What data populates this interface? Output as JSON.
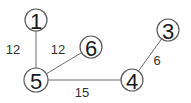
{
  "graph": {
    "nodes": [
      {
        "id": "1",
        "label": "1",
        "x": 36,
        "y": 20,
        "r": 11
      },
      {
        "id": "5",
        "label": "5",
        "x": 36,
        "y": 80,
        "r": 12
      },
      {
        "id": "6",
        "label": "6",
        "x": 91,
        "y": 47,
        "r": 11
      },
      {
        "id": "4",
        "label": "4",
        "x": 132,
        "y": 80,
        "r": 11
      },
      {
        "id": "3",
        "label": "3",
        "x": 168,
        "y": 30,
        "r": 11
      }
    ],
    "edges": [
      {
        "from": "1",
        "to": "5",
        "weight": "12",
        "lx": 13,
        "ly": 49
      },
      {
        "from": "5",
        "to": "6",
        "weight": "12",
        "lx": 58,
        "ly": 49
      },
      {
        "from": "5",
        "to": "4",
        "weight": "15",
        "lx": 82,
        "ly": 92
      },
      {
        "from": "4",
        "to": "3",
        "weight": "6",
        "lx": 157,
        "ly": 60
      }
    ]
  }
}
